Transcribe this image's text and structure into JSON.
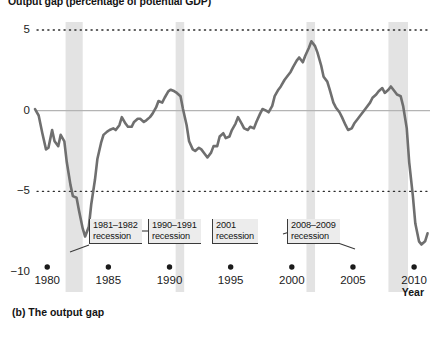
{
  "chart_data": {
    "type": "line",
    "title": "Output gap (percentage of potential GDP)",
    "caption": "(b) The output gap",
    "xlabel": "Year",
    "ylabel": "",
    "xlim": [
      1979.0,
      2011.3
    ],
    "ylim": [
      -10,
      5
    ],
    "grid": "dotted horizontal gridlines at 5 and -5; solid zero line at 0",
    "legend_position": "none",
    "x_ticks": [
      "1980",
      "1985",
      "1990",
      "1995",
      "2000",
      "2005",
      "2010"
    ],
    "x_tick_values": [
      1980,
      1985,
      1990,
      1995,
      2000,
      2005,
      2010
    ],
    "y_ticks": [
      "5",
      "0",
      "−5",
      "−10"
    ],
    "y_tick_values": [
      5,
      0,
      -5,
      -10
    ],
    "series": [
      {
        "name": "Output gap",
        "color": "#6f6f6f",
        "x": [
          1979.0,
          1979.3,
          1979.6,
          1979.9,
          1980.1,
          1980.4,
          1980.6,
          1980.9,
          1981.1,
          1981.4,
          1981.6,
          1981.9,
          1982.1,
          1982.4,
          1982.6,
          1982.9,
          1983.1,
          1983.4,
          1983.6,
          1983.9,
          1984.1,
          1984.4,
          1984.6,
          1984.9,
          1985.1,
          1985.4,
          1985.6,
          1985.9,
          1986.1,
          1986.4,
          1986.6,
          1986.9,
          1987.1,
          1987.4,
          1987.6,
          1987.9,
          1988.1,
          1988.4,
          1988.6,
          1988.9,
          1989.1,
          1989.4,
          1989.6,
          1989.9,
          1990.1,
          1990.4,
          1990.6,
          1990.9,
          1991.1,
          1991.4,
          1991.6,
          1991.9,
          1992.1,
          1992.4,
          1992.6,
          1992.9,
          1993.1,
          1993.4,
          1993.6,
          1993.9,
          1994.1,
          1994.4,
          1994.6,
          1994.9,
          1995.1,
          1995.4,
          1995.6,
          1995.9,
          1996.1,
          1996.4,
          1996.6,
          1996.9,
          1997.1,
          1997.4,
          1997.6,
          1997.9,
          1998.1,
          1998.4,
          1998.6,
          1998.9,
          1999.1,
          1999.4,
          1999.6,
          1999.9,
          2000.1,
          2000.4,
          2000.6,
          2000.9,
          2001.1,
          2001.4,
          2001.6,
          2001.9,
          2002.1,
          2002.4,
          2002.6,
          2002.9,
          2003.1,
          2003.4,
          2003.6,
          2003.9,
          2004.1,
          2004.4,
          2004.6,
          2004.9,
          2005.1,
          2005.4,
          2005.6,
          2005.9,
          2006.1,
          2006.4,
          2006.6,
          2006.9,
          2007.1,
          2007.4,
          2007.6,
          2007.9,
          2008.1,
          2008.4,
          2008.6,
          2008.9,
          2009.1,
          2009.4,
          2009.6,
          2009.9,
          2010.1,
          2010.4,
          2010.6,
          2010.9,
          2011.1
        ],
        "y": [
          0.1,
          -0.3,
          -1.4,
          -2.4,
          -2.3,
          -1.2,
          -1.9,
          -2.2,
          -1.5,
          -1.9,
          -3.2,
          -4.6,
          -5.3,
          -5.4,
          -6.2,
          -7.3,
          -7.8,
          -7.2,
          -5.8,
          -4.3,
          -3.0,
          -2.0,
          -1.5,
          -1.3,
          -1.2,
          -1.1,
          -1.2,
          -0.9,
          -0.4,
          -0.8,
          -1.0,
          -1.0,
          -0.7,
          -0.5,
          -0.5,
          -0.7,
          -0.6,
          -0.4,
          -0.2,
          0.2,
          0.6,
          0.5,
          0.8,
          1.2,
          1.3,
          1.2,
          1.1,
          0.9,
          0.1,
          -0.9,
          -1.9,
          -2.4,
          -2.5,
          -2.3,
          -2.4,
          -2.7,
          -2.9,
          -2.6,
          -2.2,
          -2.2,
          -1.6,
          -1.4,
          -1.7,
          -1.6,
          -1.2,
          -0.8,
          -0.4,
          -0.8,
          -1.1,
          -1.2,
          -1.0,
          -1.1,
          -0.7,
          -0.2,
          0.1,
          0.0,
          -0.1,
          0.3,
          0.9,
          1.3,
          1.5,
          1.9,
          2.1,
          2.4,
          2.7,
          3.1,
          3.3,
          3.0,
          3.4,
          3.9,
          4.3,
          4.0,
          3.6,
          2.8,
          2.1,
          1.8,
          1.3,
          0.5,
          0.2,
          -0.1,
          -0.4,
          -0.9,
          -1.2,
          -1.1,
          -0.8,
          -0.5,
          -0.3,
          0.0,
          0.2,
          0.5,
          0.8,
          1.0,
          1.2,
          1.4,
          1.1,
          1.3,
          1.5,
          1.2,
          1.0,
          0.9,
          0.3,
          -1.1,
          -3.2,
          -5.3,
          -7.0,
          -8.1,
          -8.3,
          -8.1,
          -7.6
        ]
      }
    ],
    "recession_bands": [
      {
        "label": "1981–1982 recession",
        "start": 1981.5,
        "end": 1982.9
      },
      {
        "label": "1990–1991 recession",
        "start": 1990.5,
        "end": 1991.2
      },
      {
        "label": "2001 recession",
        "start": 2001.2,
        "end": 2001.9
      },
      {
        "label": "2008–2009 recession",
        "start": 2007.9,
        "end": 2009.5
      }
    ]
  },
  "annotations": [
    {
      "line1": "1981–1982",
      "line2": "recession"
    },
    {
      "line1": "1990–1991",
      "line2": "recession"
    },
    {
      "line1": "2001",
      "line2": "recession"
    },
    {
      "line1": "2008–2009",
      "line2": "recession"
    }
  ],
  "colors": {
    "line": "#6f6f6f",
    "band": "#e3e3e3",
    "gridline": "#2b2b2b",
    "zero_line": "#b4b4b4",
    "annotation_bg": "#ececec",
    "annotation_border": "#3a3a3a",
    "text": "#141414"
  }
}
